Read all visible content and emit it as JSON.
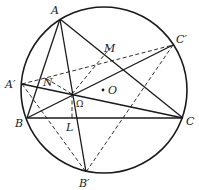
{
  "figure": {
    "circle": {
      "cx": 104,
      "cy": 90,
      "r": 83
    },
    "points": {
      "A": {
        "x": 60,
        "y": 19,
        "label": "A",
        "lx": 51,
        "ly": 14
      },
      "B": {
        "x": 27,
        "y": 118,
        "label": "B",
        "lx": 15,
        "ly": 127
      },
      "C": {
        "x": 183,
        "y": 118,
        "label": "C",
        "lx": 186,
        "ly": 125
      },
      "A_prime": {
        "x": 22,
        "y": 84,
        "label": "A′",
        "lx": 5,
        "ly": 88
      },
      "B_prime": {
        "x": 86,
        "y": 172,
        "label": "B′",
        "lx": 79,
        "ly": 187
      },
      "C_prime": {
        "x": 173,
        "y": 45,
        "label": "C′",
        "lx": 176,
        "ly": 43
      },
      "Omega": {
        "x": 72,
        "y": 94,
        "label": "Ω",
        "lx": 76,
        "ly": 107
      },
      "M": {
        "x": 110,
        "y": 48,
        "label": "M",
        "lx": 104,
        "ly": 52
      },
      "N": {
        "x": 47,
        "y": 79,
        "label": "N",
        "lx": 43,
        "ly": 86
      },
      "L": {
        "x": 72,
        "y": 118,
        "label": "L",
        "lx": 66,
        "ly": 131
      },
      "O": {
        "x": 103,
        "y": 90,
        "label": "O",
        "lx": 108,
        "ly": 94
      }
    },
    "solid_lines": [
      [
        "A",
        "B"
      ],
      [
        "A",
        "C"
      ],
      [
        "B",
        "C"
      ],
      [
        "A",
        "B_prime"
      ],
      [
        "A_prime",
        "C"
      ],
      [
        "B",
        "C_prime"
      ]
    ],
    "dashed_lines": [
      [
        "A_prime",
        "C_prime"
      ],
      [
        "A_prime",
        "B_prime"
      ],
      [
        "C_prime",
        "B_prime"
      ],
      [
        "Omega",
        "M"
      ],
      [
        "Omega",
        "N"
      ],
      [
        "Omega",
        "L"
      ]
    ]
  }
}
